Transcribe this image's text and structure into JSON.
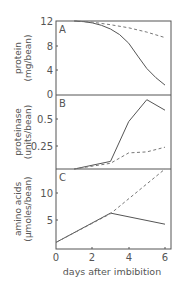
{
  "chart_data": [
    {
      "panel": "A",
      "type": "line",
      "ylabel_line1": "protein",
      "ylabel_line2": "(mg/bean)",
      "ylim": [
        0,
        12
      ],
      "yticks": [
        "0",
        "4",
        "8",
        "12"
      ],
      "xlim": [
        0,
        6
      ],
      "series": [
        {
          "name": "solid",
          "style": "solid",
          "x": [
            1,
            1.5,
            2,
            2.5,
            3,
            3.5,
            4,
            4.5,
            5,
            5.5,
            6
          ],
          "values": [
            12,
            11.9,
            11.7,
            11.3,
            10.7,
            9.8,
            8.4,
            6.3,
            4.3,
            2.8,
            1.6
          ]
        },
        {
          "name": "dashed",
          "style": "dashed",
          "x": [
            1,
            2,
            3,
            4,
            5,
            6
          ],
          "values": [
            12,
            11.8,
            11.4,
            10.9,
            10.2,
            9.3
          ]
        }
      ]
    },
    {
      "panel": "B",
      "type": "line",
      "ylabel_line1": "proteinase",
      "ylabel_line2": "(units/bean)",
      "ylim": [
        0,
        0.78
      ],
      "yticks": [
        "0.25",
        "0.5"
      ],
      "xlim": [
        0,
        6
      ],
      "series": [
        {
          "name": "solid",
          "style": "solid",
          "x": [
            1,
            3,
            4,
            5,
            6
          ],
          "values": [
            0,
            0.08,
            0.5,
            0.73,
            0.62
          ]
        },
        {
          "name": "dashed",
          "style": "dashed",
          "x": [
            1,
            3,
            4,
            5,
            6
          ],
          "values": [
            0,
            0.06,
            0.17,
            0.18,
            0.23
          ]
        }
      ]
    },
    {
      "panel": "C",
      "type": "line",
      "ylabel_line1": "amino acids",
      "ylabel_line2": "(µmoles/bean)",
      "ylim": [
        0,
        14.5
      ],
      "yticks": [
        "5",
        "10"
      ],
      "xlim": [
        0,
        6
      ],
      "xticks": [
        "0",
        "2",
        "4",
        "6"
      ],
      "xlabel": "days after imbibition",
      "series": [
        {
          "name": "solid",
          "style": "solid",
          "x": [
            0,
            3,
            6
          ],
          "values": [
            1.2,
            6.5,
            4.5
          ]
        },
        {
          "name": "dashed",
          "style": "dashed",
          "x": [
            0,
            3,
            6
          ],
          "values": [
            1.2,
            6.4,
            14.5
          ]
        }
      ]
    }
  ],
  "labels": {
    "panel_a": "A",
    "panel_b": "B",
    "panel_c": "C",
    "a_y1": "protein",
    "a_y2": "(mg/bean)",
    "b_y1": "proteinase",
    "b_y2": "(units/bean)",
    "c_y1": "amino acids",
    "c_y2": "(µmoles/bean)",
    "a_tick_12": "12",
    "a_tick_8": "8",
    "a_tick_4": "4",
    "a_tick_0": "0",
    "b_tick_05": "0.5",
    "b_tick_025": "0.25",
    "c_tick_10": "10",
    "c_tick_5": "5",
    "x_tick_0": "0",
    "x_tick_2": "2",
    "x_tick_4": "4",
    "x_tick_6": "6",
    "xlabel": "days after imbibition"
  }
}
